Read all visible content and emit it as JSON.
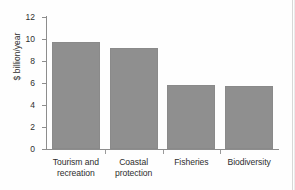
{
  "chart_data": {
    "type": "bar",
    "title": "",
    "subtitle": "",
    "xlabel": "",
    "ylabel": "$ billion/year",
    "categories": [
      "Tourism and recreation",
      "Coastal protection",
      "Fisheries",
      "Biodiversity"
    ],
    "category_lines": [
      [
        "Tourism and",
        "recreation"
      ],
      [
        "Coastal",
        "protection"
      ],
      [
        "Fisheries"
      ],
      [
        "Biodiversity"
      ]
    ],
    "values": [
      9.7,
      9.2,
      5.8,
      5.7
    ],
    "ylim": [
      0,
      12
    ],
    "yticks": [
      0,
      2,
      4,
      6,
      8,
      10,
      12
    ],
    "ytick_labels": [
      "0",
      "2",
      "4",
      "6",
      "8",
      "10",
      "12"
    ],
    "grid": false,
    "legend": null,
    "bar_color": "#8f8f8f",
    "axis_color": "#8d8d8d",
    "background": "#ffffff"
  }
}
